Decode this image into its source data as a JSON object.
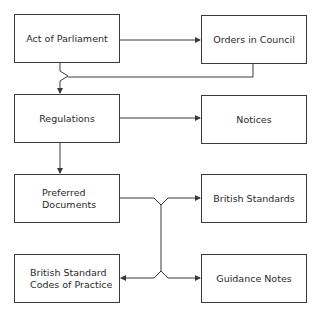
{
  "diagram": {
    "nodes": [
      {
        "id": "act",
        "label": "Act of Parliament"
      },
      {
        "id": "orders",
        "label": "Orders in Council"
      },
      {
        "id": "regulations",
        "label": "Regulations"
      },
      {
        "id": "notices",
        "label": "Notices"
      },
      {
        "id": "preferred",
        "label": "Preferred\nDocuments"
      },
      {
        "id": "bs",
        "label": "British Standards"
      },
      {
        "id": "bscp",
        "label": "British Standard\nCodes of Practice"
      },
      {
        "id": "guidance",
        "label": "Guidance Notes"
      }
    ],
    "edges": [
      {
        "from": "act",
        "to": "orders"
      },
      {
        "from": "act",
        "to": "regulations"
      },
      {
        "from": "orders",
        "to": "regulations"
      },
      {
        "from": "regulations",
        "to": "notices"
      },
      {
        "from": "regulations",
        "to": "preferred"
      },
      {
        "from": "preferred",
        "to": "bs"
      },
      {
        "from": "preferred",
        "to": "bscp"
      },
      {
        "from": "preferred",
        "to": "guidance"
      }
    ],
    "colors": {
      "line": "#3a3a3a",
      "text": "#2a2a2a",
      "background": "#ffffff"
    }
  }
}
